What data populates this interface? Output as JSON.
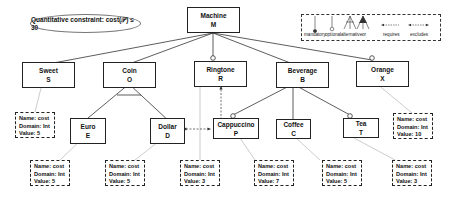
{
  "constraint": {
    "text": "Quantitative constraint: cost(𝒫) ≤ 30"
  },
  "legend": {
    "items": [
      "mandatory",
      "optional",
      "alternative",
      "or",
      "requires",
      "excludes"
    ]
  },
  "features": {
    "machine": {
      "name": "Machine",
      "abbr": "M"
    },
    "sweet": {
      "name": "Sweet",
      "abbr": "S"
    },
    "coin": {
      "name": "Coin",
      "abbr": "O"
    },
    "ringtone": {
      "name": "Ringtone",
      "abbr": "R"
    },
    "beverage": {
      "name": "Beverage",
      "abbr": "B"
    },
    "orange": {
      "name": "Orange",
      "abbr": "X"
    },
    "euro": {
      "name": "Euro",
      "abbr": "E"
    },
    "dollar": {
      "name": "Dollar",
      "abbr": "D"
    },
    "cappuccino": {
      "name": "Cappuccino",
      "abbr": "P"
    },
    "coffee": {
      "name": "Coffee",
      "abbr": "C"
    },
    "tea": {
      "name": "Tea",
      "abbr": "T"
    }
  },
  "attributes": {
    "sweet": {
      "name": "Name: cost",
      "domain": "Domain: Int",
      "value": "Value: 5"
    },
    "orange": {
      "name": "Name: cost",
      "domain": "Domain: Int",
      "value": "Value: 10"
    },
    "euro": {
      "name": "Name: cost",
      "domain": "Domain: Int",
      "value": "Value: 5"
    },
    "dollar": {
      "name": "Name: cost",
      "domain": "Domain: Int",
      "value": "Value: 5"
    },
    "ringtone": {
      "name": "Name: cost",
      "domain": "Domain: Int",
      "value": "Value: 3"
    },
    "cappuccino": {
      "name": "Name: cost",
      "domain": "Domain: Int",
      "value": "Value: 7"
    },
    "coffee": {
      "name": "Name: cost",
      "domain": "Domain: Int",
      "value": "Value: 5"
    },
    "tea": {
      "name": "Name: cost",
      "domain": "Domain: Int",
      "value": "Value: 3"
    }
  }
}
